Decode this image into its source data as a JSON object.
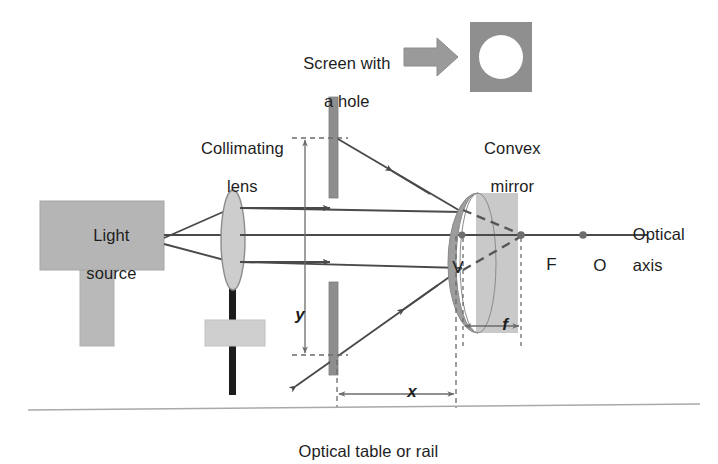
{
  "figure": {
    "type": "optics-ray-diagram",
    "background": "#ffffff"
  },
  "labels": {
    "light_source_line1": "Light",
    "light_source_line2": "source",
    "collimating_lens_line1": "Collimating",
    "collimating_lens_line2": "lens",
    "screen_with_hole_line1": "Screen with",
    "screen_with_hole_line2": "a hole",
    "convex_mirror_line1": "Convex",
    "convex_mirror_line2": "mirror",
    "optical_axis_line1": "Optical",
    "optical_axis_line2": "axis",
    "optical_table": "Optical table or rail",
    "vertex": "V",
    "focus": "F",
    "center": "O",
    "dim_y": "y",
    "dim_x": "x",
    "dim_f": "f"
  },
  "colors": {
    "device_fill": "#b3b3b3",
    "device_stroke": "#9a9a9a",
    "lens_fill": "#cdcdcd",
    "lens_stroke": "#8c8c8c",
    "screen_bar": "#8e8e8e",
    "mirror_front": "#9d9d9d",
    "mirror_body": "#c9c9c9",
    "inset_fill": "#8f8f8f",
    "hole_fill": "#ffffff",
    "arrow_fill": "#9a9a9a",
    "ray": "#4a4a4a",
    "dim_line": "#6b6b6b",
    "dashed": "#7a7a7a",
    "rail": "#a9a9a9",
    "post": "#1c1c1c",
    "text": "#1d1d1d"
  },
  "geometry": {
    "optical_axis_y": 235,
    "mirror_vertex_x": 462,
    "focus_x": 521,
    "center_x": 583,
    "screen_x": 334,
    "lens_x": 233,
    "upper_ray_y": 208,
    "lower_ray_y": 262,
    "y_top": 138,
    "y_bottom": 355
  },
  "dimensions": {
    "x_from": 337,
    "x_to": 455,
    "f_from": 462,
    "f_to": 521
  }
}
